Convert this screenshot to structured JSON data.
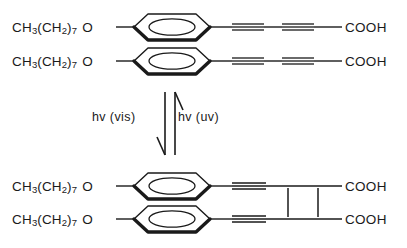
{
  "diagram": {
    "type": "reaction-scheme",
    "background_color": "#ffffff",
    "line_color": "#1a1a1a"
  },
  "monomer": {
    "name": "monomer-assembly",
    "rows": [
      {
        "alkoxy_head": "CH",
        "alkoxy_sub1": "3",
        "alkoxy_mid": "(CH",
        "alkoxy_sub2": "2",
        "alkoxy_close": ")",
        "alkoxy_sub3": "7",
        "alkoxy_tail": "O",
        "terminus": "COOH"
      },
      {
        "alkoxy_head": "CH",
        "alkoxy_sub1": "3",
        "alkoxy_mid": "(CH",
        "alkoxy_sub2": "2",
        "alkoxy_close": ")",
        "alkoxy_sub3": "7",
        "alkoxy_tail": "O",
        "terminus": "COOH"
      }
    ],
    "ring": "benzene-ring",
    "chain_bonds": [
      "triple",
      "single",
      "triple",
      "single"
    ]
  },
  "polymer": {
    "name": "polymer-assembly",
    "rows": [
      {
        "alkoxy_head": "CH",
        "alkoxy_sub1": "3",
        "alkoxy_mid": "(CH",
        "alkoxy_sub2": "2",
        "alkoxy_close": ")",
        "alkoxy_sub3": "7",
        "alkoxy_tail": "O",
        "terminus": "COOH"
      },
      {
        "alkoxy_head": "CH",
        "alkoxy_sub1": "3",
        "alkoxy_mid": "(CH",
        "alkoxy_sub2": "2",
        "alkoxy_close": ")",
        "alkoxy_sub3": "7",
        "alkoxy_tail": "O",
        "terminus": "COOH"
      }
    ],
    "ring": "benzene-ring",
    "chain_bonds": [
      "triple",
      "single"
    ],
    "crosslink_count": 2
  },
  "arrows": {
    "forward": {
      "label": "hv (vis)",
      "direction": "down",
      "meaning": "visible light"
    },
    "reverse": {
      "label": "hv (uv)",
      "direction": "up",
      "meaning": "ultraviolet light"
    }
  }
}
